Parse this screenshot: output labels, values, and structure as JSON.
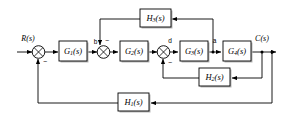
{
  "diagram": {
    "type": "block-diagram",
    "canvas": {
      "width": 283,
      "height": 122
    },
    "signals": {
      "input": "R(s)",
      "output": "C(s)"
    },
    "node_labels": {
      "b": "b",
      "d": "d",
      "a": "a"
    },
    "signs": {
      "sum1": "−",
      "sum2": "−",
      "sum3": "−"
    },
    "blocks": [
      {
        "id": "G1",
        "base": "G",
        "sub": "1",
        "arg": "(s)",
        "label": "G1(s)"
      },
      {
        "id": "G2",
        "base": "G",
        "sub": "2",
        "arg": "(s)",
        "label": "G2(s)"
      },
      {
        "id": "G3",
        "base": "G",
        "sub": "3",
        "arg": "(s)",
        "label": "G3(s)"
      },
      {
        "id": "G4",
        "base": "G",
        "sub": "4",
        "arg": "(s)",
        "label": "G4(s)"
      },
      {
        "id": "H1",
        "base": "H",
        "sub": "1",
        "arg": "(s)",
        "label": "H1(s)"
      },
      {
        "id": "H2",
        "base": "H",
        "sub": "2",
        "arg": "(s)",
        "label": "H2(s)"
      },
      {
        "id": "H3",
        "base": "H",
        "sub": "3",
        "arg": "(s)",
        "label": "H3(s)"
      }
    ],
    "colors": {
      "line": "#000000",
      "block_fill": "#ffffff",
      "shadow": "#b8b8b8",
      "background": "#ffffff"
    }
  }
}
